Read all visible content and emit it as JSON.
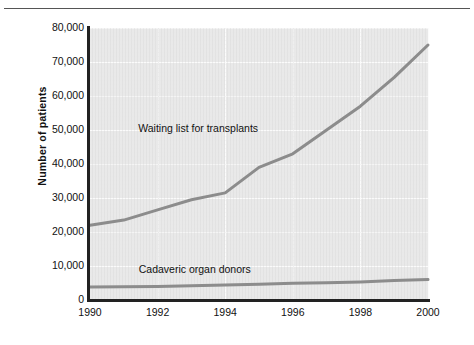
{
  "chart_data": {
    "type": "line",
    "title": "",
    "subtitle": "",
    "xlabel": "",
    "ylabel": "Number of patients",
    "x": [
      1990,
      1991,
      1992,
      1993,
      1994,
      1995,
      1996,
      1997,
      1998,
      1999,
      2000
    ],
    "xlim": [
      1990,
      2000
    ],
    "ylim": [
      0,
      80000
    ],
    "grid": true,
    "legend_position": "inline-annotation",
    "x_tick_labels": [
      "1990",
      "1992",
      "1994",
      "1996",
      "1998",
      "2000"
    ],
    "x_tick_values": [
      1990,
      1992,
      1994,
      1996,
      1998,
      2000
    ],
    "y_tick_labels": [
      "0",
      "10,000",
      "20,000",
      "30,000",
      "40,000",
      "50,000",
      "60,000",
      "70,000",
      "80,000"
    ],
    "y_tick_values": [
      0,
      10000,
      20000,
      30000,
      40000,
      50000,
      60000,
      70000,
      80000
    ],
    "series": [
      {
        "name": "Waiting list for transplants",
        "color": "#8c8c8c",
        "values": [
          22000,
          23500,
          26500,
          29500,
          31500,
          39000,
          43000,
          50000,
          57000,
          65500,
          75000
        ],
        "annotation": "Waiting list for transplants",
        "annotation_x": 1993.2,
        "annotation_y": 50500
      },
      {
        "name": "Cadaveric organ donors",
        "color": "#8c8c8c",
        "values": [
          3800,
          3900,
          4000,
          4200,
          4400,
          4600,
          4900,
          5100,
          5300,
          5700,
          6000
        ],
        "annotation": "Cadaveric organ donors",
        "annotation_x": 1993.1,
        "annotation_y": 9200
      }
    ]
  },
  "figure": {
    "background_color": "#ffffff",
    "plot_background_color": "#e9e9e9",
    "gridline_color": "#fbfbfb",
    "axis_color": "#222222",
    "line_color": "#8c8c8c"
  }
}
